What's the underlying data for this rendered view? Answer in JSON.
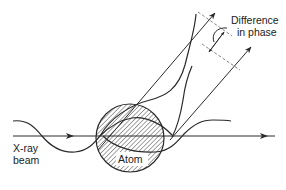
{
  "diagram": {
    "labels": {
      "beam_line1": "X-ray",
      "beam_line2": "beam",
      "atom": "Atom",
      "phase_line1": "Difference",
      "phase_line2": "in phase"
    },
    "colors": {
      "stroke": "#2a2a2a",
      "hatch": "#4a4a4a",
      "dashed": "#777777",
      "background": "#ffffff"
    },
    "elements": [
      {
        "id": "incident-beam",
        "type": "horizontal arrow line"
      },
      {
        "id": "incident-wave",
        "type": "sinusoidal wave"
      },
      {
        "id": "atom",
        "type": "hatched circle"
      },
      {
        "id": "scattered-ray-upper",
        "type": "diagonal arrow line"
      },
      {
        "id": "scattered-ray-lower",
        "type": "diagonal arrow line"
      },
      {
        "id": "scattered-wave-upper",
        "type": "wave"
      },
      {
        "id": "scattered-wave-lower",
        "type": "wave"
      },
      {
        "id": "transmitted-wave",
        "type": "sinusoidal wave"
      },
      {
        "id": "wavefront-dashed-lines",
        "type": "dashed perpendicular lines"
      },
      {
        "id": "phase-difference-marker",
        "type": "double arrow with leader"
      }
    ]
  }
}
